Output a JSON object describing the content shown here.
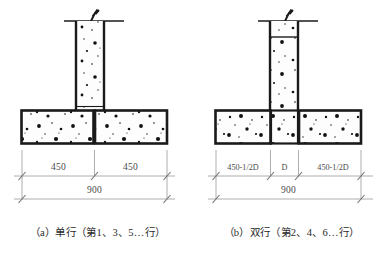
{
  "figure": {
    "title_visible": false,
    "subfigures": [
      {
        "id": "a",
        "caption": "（a）单行（第1、3、5…行）",
        "dimensions": {
          "upper": [
            "450",
            "450"
          ],
          "lower": [
            "900"
          ]
        },
        "footing_segments": 2,
        "column_top_joint": false,
        "column_base_joint": true,
        "break_symbol": "zigzag-break"
      },
      {
        "id": "b",
        "caption": "（b）双行（第2、4、6…行）",
        "dimensions": {
          "upper": [
            "450-1/2D",
            "D",
            "450-1/2D"
          ],
          "lower": [
            "900"
          ]
        },
        "footing_segments": 3,
        "column_top_joint": true,
        "column_base_joint": false,
        "break_symbol": "zigzag-break"
      }
    ]
  },
  "labels": {
    "dim_450": "450",
    "dim_900": "900",
    "dim_450_half_d_left": "450-1/2D",
    "dim_d": "D",
    "dim_450_half_d_right": "450-1/2D",
    "caption_a": "（a）单行（第1、3、5…行）",
    "caption_b": "（b）双行（第2、4、6…行）"
  },
  "colors": {
    "outline": "#1a1a1a",
    "hatch_dot": "#111111",
    "fill": "#fdfdfd",
    "dimension_line": "#8b8b8b",
    "dimension_text": "#4a4a4a",
    "caption_text": "#2a2a2a",
    "background": "#ffffff"
  }
}
